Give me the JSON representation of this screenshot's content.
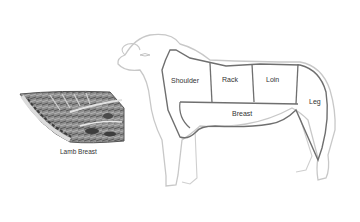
{
  "diagram": {
    "cut_labels": {
      "shoulder": "Shoulder",
      "rack": "Rack",
      "loin": "Loin",
      "breast": "Breast",
      "leg": "Leg"
    },
    "inset": {
      "caption": "Lamb Breast"
    },
    "colors": {
      "outline": "#c8c8c8",
      "cut_lines": "#6f6f6f",
      "text": "#333333",
      "meat_dark": "#4a4a4a",
      "meat_light": "#b5b5b5"
    }
  }
}
